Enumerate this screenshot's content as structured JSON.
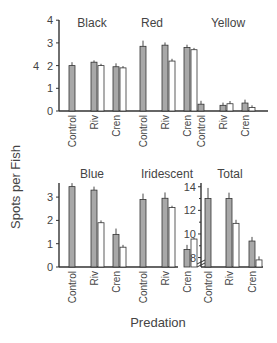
{
  "chart_data": [
    {
      "type": "bar",
      "title": "Black",
      "categories": [
        "Control",
        "Riv",
        "Cren"
      ],
      "series": [
        {
          "name": "before",
          "color": "#a8a8a8",
          "values": [
            2.0,
            2.15,
            1.95
          ],
          "errors": [
            0.15,
            0.08,
            0.15
          ]
        },
        {
          "name": "after",
          "color": "#ffffff",
          "values": [
            null,
            2.0,
            1.9
          ],
          "errors": [
            0,
            0.08,
            0.08
          ]
        }
      ],
      "ylim": [
        0,
        4
      ],
      "yticks": [
        0,
        1,
        2,
        3,
        4
      ]
    },
    {
      "type": "bar",
      "title": "Red",
      "categories": [
        "Control",
        "Riv",
        "Cren"
      ],
      "series": [
        {
          "name": "before",
          "color": "#a8a8a8",
          "values": [
            2.85,
            2.9,
            2.8
          ],
          "errors": [
            0.25,
            0.12,
            0.12
          ]
        },
        {
          "name": "after",
          "color": "#ffffff",
          "values": [
            null,
            2.2,
            2.7
          ],
          "errors": [
            0,
            0.1,
            0.08
          ]
        }
      ],
      "ylim": [
        0,
        4
      ]
    },
    {
      "type": "bar",
      "title": "Yellow",
      "categories": [
        "Control",
        "Riv",
        "Cren"
      ],
      "series": [
        {
          "name": "before",
          "color": "#a8a8a8",
          "values": [
            0.3,
            0.25,
            0.35
          ],
          "errors": [
            0.15,
            0.12,
            0.15
          ]
        },
        {
          "name": "after",
          "color": "#ffffff",
          "values": [
            null,
            0.32,
            0.15
          ],
          "errors": [
            0,
            0.12,
            0.1
          ]
        }
      ],
      "ylim": [
        0,
        4
      ]
    },
    {
      "type": "bar",
      "title": "Blue",
      "categories": [
        "Control",
        "Riv",
        "Cren"
      ],
      "series": [
        {
          "name": "before",
          "color": "#a8a8a8",
          "values": [
            3.45,
            3.3,
            1.4
          ],
          "errors": [
            0.15,
            0.15,
            0.25
          ]
        },
        {
          "name": "after",
          "color": "#ffffff",
          "values": [
            null,
            1.9,
            0.85
          ],
          "errors": [
            0,
            0.1,
            0.1
          ]
        }
      ],
      "ylim": [
        0,
        3.8
      ],
      "yticks": [
        0,
        1,
        2,
        3
      ]
    },
    {
      "type": "bar",
      "title": "Iridescent",
      "categories": [
        "Control",
        "Riv",
        "Cren"
      ],
      "series": [
        {
          "name": "before",
          "color": "#a8a8a8",
          "values": [
            2.9,
            2.95,
            0.75
          ],
          "errors": [
            0.25,
            0.25,
            0.2
          ]
        },
        {
          "name": "after",
          "color": "#ffffff",
          "values": [
            null,
            2.55,
            1.2
          ],
          "errors": [
            0,
            0.08,
            0.05
          ]
        }
      ],
      "ylim": [
        0,
        3.8
      ]
    },
    {
      "type": "bar",
      "title": "Total",
      "categories": [
        "Control",
        "Riv",
        "Cren"
      ],
      "series": [
        {
          "name": "before",
          "color": "#a8a8a8",
          "values": [
            13.0,
            13.0,
            9.4
          ],
          "errors": [
            0.9,
            0.5,
            0.35
          ]
        },
        {
          "name": "after",
          "color": "#ffffff",
          "values": [
            null,
            10.9,
            7.8
          ],
          "errors": [
            0,
            0.3,
            0.3
          ]
        }
      ],
      "ylim": [
        7.2,
        14.5
      ],
      "yticks": [
        8,
        10,
        12,
        14
      ],
      "axis_break": true
    }
  ],
  "labels": {
    "ylabel": "Spots per Fish",
    "xlabel": "Predation",
    "side_number": "4",
    "panel_titles": [
      "Black",
      "Red",
      "Yellow",
      "Blue",
      "Iridescent",
      "Total"
    ],
    "categories": [
      "Control",
      "Riv",
      "Cren"
    ],
    "top_ticks": [
      "0",
      "1",
      "2",
      "3",
      "4"
    ],
    "bottom_ticks": [
      "0",
      "1",
      "2",
      "3"
    ],
    "total_ticks": [
      "8",
      "10",
      "12",
      "14"
    ]
  },
  "colors": {
    "bar_fill": "#a8a8a8",
    "bar_open": "#ffffff",
    "axis": "#333333",
    "text": "#444444"
  }
}
